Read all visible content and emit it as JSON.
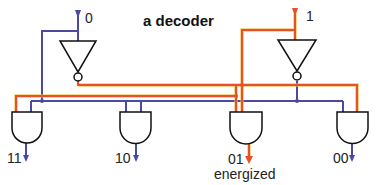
{
  "title": "a decoder",
  "inputs": [
    {
      "label": "0",
      "state": "off"
    },
    {
      "label": "1",
      "state": "on"
    }
  ],
  "outputs": [
    {
      "label": "11",
      "state": "off"
    },
    {
      "label": "10",
      "state": "off"
    },
    {
      "label": "01",
      "state": "on",
      "note": "energized"
    },
    {
      "label": "00",
      "state": "off"
    }
  ],
  "colors": {
    "off_wire": "#4a4aa0",
    "on_wire": "#e8502a",
    "on_glow": "#f5c04a",
    "gate_stroke": "#111111"
  }
}
